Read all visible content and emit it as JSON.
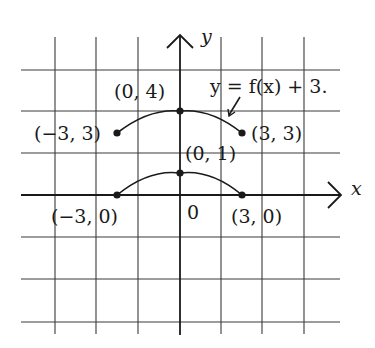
{
  "axes": {
    "x_label": "x",
    "y_label": "y",
    "origin_label": "0"
  },
  "curves": [
    {
      "name": "f(x)",
      "points": [
        {
          "label": "(−3, 0)",
          "x": -3,
          "y": 0
        },
        {
          "label": "(0, 1)",
          "x": 0,
          "y": 1
        },
        {
          "label": "(3, 0)",
          "x": 3,
          "y": 0
        }
      ]
    },
    {
      "name": "f(x) + 3",
      "annotation": "y = f(x) + 3.",
      "points": [
        {
          "label": "(−3, 3)",
          "x": -3,
          "y": 3
        },
        {
          "label": "(0, 4)",
          "x": 0,
          "y": 4
        },
        {
          "label": "(3, 3)",
          "x": 3,
          "y": 3
        }
      ]
    }
  ],
  "grid": {
    "x_range": [
      -4,
      4
    ],
    "y_range": [
      -3,
      3
    ],
    "note": "grid spacing 1 unit = 1.5 grid squares horizontally (points at ±3 fall between lines)"
  },
  "colors": {
    "ink": "#1a1a1a",
    "grid": "#3a3a3a",
    "background": "#ffffff"
  }
}
